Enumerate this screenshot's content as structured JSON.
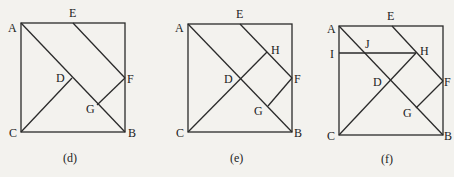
{
  "figures": [
    {
      "caption": "(d)",
      "points": {
        "A": "A",
        "E": "E",
        "F": "F",
        "D": "D",
        "G": "G",
        "C": "C",
        "B": "B"
      }
    },
    {
      "caption": "(e)",
      "points": {
        "A": "A",
        "E": "E",
        "H": "H",
        "F": "F",
        "D": "D",
        "G": "G",
        "C": "C",
        "B": "B"
      }
    },
    {
      "caption": "(f)",
      "points": {
        "A": "A",
        "E": "E",
        "I": "I",
        "J": "J",
        "H": "H",
        "F": "F",
        "D": "D",
        "G": "G",
        "C": "C",
        "B": "B"
      }
    }
  ]
}
